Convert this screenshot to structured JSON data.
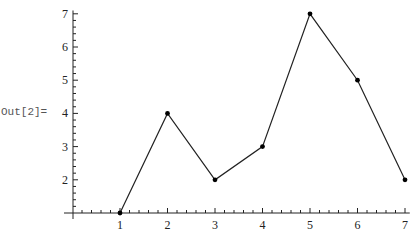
{
  "cell": {
    "output_label": "Out[2]="
  },
  "colors": {
    "line": "#222222",
    "axis": "#222222",
    "point": "#000000"
  },
  "chart_data": {
    "type": "line",
    "title": "",
    "xlabel": "",
    "ylabel": "",
    "x": [
      1,
      2,
      3,
      4,
      5,
      6,
      7
    ],
    "series": [
      {
        "name": "data",
        "values": [
          1,
          4,
          2,
          3,
          7,
          5,
          2
        ]
      }
    ],
    "x_ticks": [
      1,
      2,
      3,
      4,
      5,
      6,
      7
    ],
    "y_ticks": [
      2,
      3,
      4,
      5,
      6,
      7
    ],
    "xlim": [
      0.07,
      7.1
    ],
    "ylim": [
      1,
      7.1
    ],
    "axes_origin": [
      0.07,
      1
    ],
    "grid": false,
    "markers": true
  }
}
